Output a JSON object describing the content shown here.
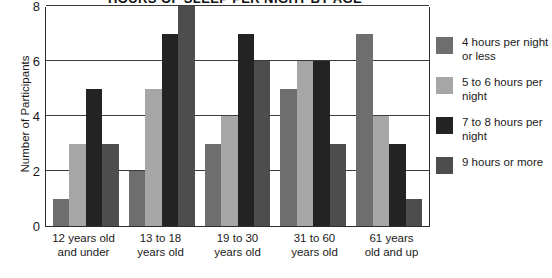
{
  "chart_data": {
    "type": "bar",
    "title": "HOURS OF SLEEP PER NIGHT BY AGE",
    "xlabel": "",
    "ylabel": "Number of Participants",
    "ylim": [
      0,
      8
    ],
    "yticks": [
      0,
      2,
      4,
      6,
      8
    ],
    "grid": true,
    "legend_position": "right",
    "categories": [
      "12 years old\nand under",
      "13 to 18\nyears old",
      "19 to 30\nyears old",
      "31 to 60\nyears old",
      "61 years\nold and up"
    ],
    "series": [
      {
        "name": "4 hours per night or less",
        "color": "#6e6e6e",
        "values": [
          1,
          2,
          3,
          5,
          7
        ]
      },
      {
        "name": "5 to 6 hours per night",
        "color": "#a6a6a6",
        "values": [
          3,
          5,
          4,
          6,
          4
        ]
      },
      {
        "name": "7 to 8 hours per night",
        "color": "#232323",
        "values": [
          5,
          7,
          7,
          6,
          3
        ]
      },
      {
        "name": "9 hours or more",
        "color": "#4d4d4d",
        "values": [
          3,
          8,
          6,
          3,
          1
        ]
      }
    ]
  },
  "legend": {
    "items": [
      {
        "label": "4 hours per night or less"
      },
      {
        "label": "5 to 6 hours per night"
      },
      {
        "label": "7 to 8 hours per night"
      },
      {
        "label": "9 hours or more"
      }
    ]
  }
}
